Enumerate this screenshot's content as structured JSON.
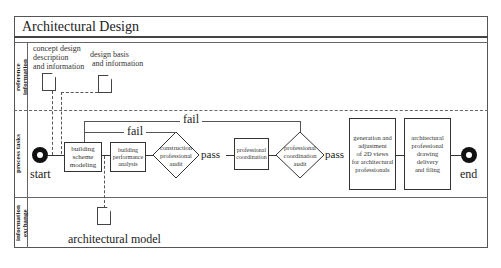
{
  "diagram": {
    "title": "Architectural Design",
    "lanes": [
      {
        "id": "reference",
        "label": "reference information"
      },
      {
        "id": "process",
        "label": "process tasks"
      },
      {
        "id": "exchange",
        "label": "information exchange"
      }
    ],
    "reference_docs": [
      {
        "label": "concept design description and information",
        "lines": [
          "concept design",
          "description",
          "and information"
        ]
      },
      {
        "label": "design basis and information",
        "lines": [
          "design basis",
          "and information"
        ]
      }
    ],
    "nodes": {
      "start": "start",
      "end": "end",
      "building_scheme": [
        "building",
        "scheme",
        "modeling"
      ],
      "building_performance": [
        "building",
        "performance",
        "analysis"
      ],
      "construction_audit": [
        "construction",
        "professional",
        "audit"
      ],
      "professional_coordination": [
        "professional",
        "coordination"
      ],
      "coordination_audit": [
        "professional",
        "coordination",
        "audit"
      ],
      "generation_2d": [
        "generation and",
        "adjustment",
        "of 2D views",
        "for architectural",
        "professionals"
      ],
      "drawing_delivery": [
        "architectural",
        "professional",
        "drawing",
        "delivery",
        "and filing"
      ]
    },
    "edge_labels": {
      "fail_inner": "fail",
      "fail_outer": "fail",
      "pass_1": "pass",
      "pass_2": "pass"
    },
    "exchange_doc": "architectural model"
  }
}
